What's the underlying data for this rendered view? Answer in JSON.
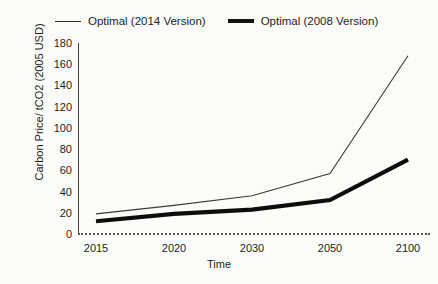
{
  "chart_data": {
    "type": "line",
    "title": "",
    "xlabel": "Time",
    "ylabel": "Carbon Price/ tCO2 (2005 USD)",
    "categories": [
      "2015",
      "2020",
      "2030",
      "2050",
      "2100"
    ],
    "ylim": [
      0,
      180
    ],
    "ytick_labels": [
      "180",
      "160",
      "140",
      "120",
      "100",
      "80",
      "60",
      "40",
      "20",
      "0"
    ],
    "ytick_values": [
      180,
      160,
      140,
      120,
      100,
      80,
      60,
      40,
      20,
      0
    ],
    "grid": false,
    "legend_position": "top",
    "series": [
      {
        "name": "Optimal (2014 Version)",
        "style": "thin",
        "color": "#3a3a3a",
        "values": [
          19,
          27,
          36,
          57,
          168
        ]
      },
      {
        "name": "Optimal (2008 Version)",
        "style": "thick",
        "color": "#0d0d0d",
        "values": [
          12,
          19,
          23,
          32,
          70
        ]
      }
    ]
  },
  "legend": {
    "entries": [
      {
        "label": "Optimal (2014 Version)"
      },
      {
        "label": "Optimal (2008 Version)"
      }
    ]
  }
}
